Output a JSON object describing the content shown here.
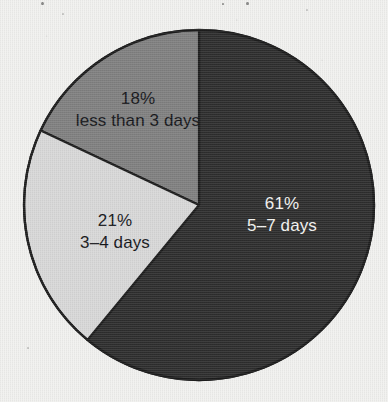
{
  "chart_data": {
    "type": "pie",
    "title": "",
    "subtitle": "",
    "xlabel": "",
    "ylabel": "",
    "legend": "none",
    "grid": false,
    "start_angle_deg": 0,
    "direction": "clockwise",
    "categories": [
      "5–7 days",
      "less than 3 days",
      "3–4 days"
    ],
    "values": [
      61,
      18,
      21
    ],
    "value_unit": "%",
    "slices": [
      {
        "label": "5–7 days",
        "percent_text": "61%",
        "value": 61,
        "color": "#2e2e2e",
        "text_color": "#f4f4f2",
        "start_deg": 0,
        "sweep_deg": 219.6
      },
      {
        "label": "less than 3 days",
        "percent_text": "18%",
        "value": 18,
        "color": "#808080",
        "text_color": "#15161a",
        "start_deg": 295.2,
        "sweep_deg": 64.8
      },
      {
        "label": "3–4 days",
        "percent_text": "21%",
        "value": 21,
        "color": "#d8d8d8",
        "text_color": "#15161a",
        "start_deg": 219.6,
        "sweep_deg": 75.6
      }
    ]
  },
  "chart": {
    "geometry": {
      "center_x": 199,
      "center_y": 205,
      "radius": 175
    },
    "outline_color": "#1d1d1d",
    "page_background": "#f1f1ef"
  },
  "labels": {
    "less_than_3_days": {
      "percent": "18%",
      "category": "less than 3 days"
    },
    "three_to_four_days": {
      "percent": "21%",
      "category": "3–4 days"
    },
    "five_to_seven_days": {
      "percent": "61%",
      "category": "5–7 days"
    }
  }
}
